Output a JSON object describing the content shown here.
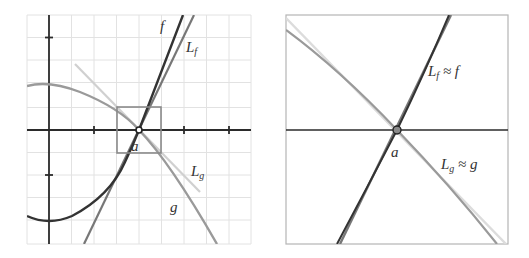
{
  "figure": {
    "left_panel": {
      "description": "Graphs of f and g with their tangent lines L_f and L_g at x = a; a small square marks the zoom region",
      "grid": {
        "x_start": 27,
        "x_end": 251,
        "y_start": 15,
        "y_end": 244,
        "spacing": 22.5
      },
      "axes": {
        "origin_x": 49,
        "origin_y": 130,
        "tick_step_px": 45
      },
      "zoom_box": {
        "x": 117,
        "y": 107,
        "width": 44,
        "height": 46
      },
      "point_a": {
        "x": 139,
        "y": 130
      },
      "labels": {
        "f": "f",
        "L_f_main": "L",
        "L_f_sub": "f",
        "L_g_main": "L",
        "L_g_sub": "g",
        "g": "g",
        "a": "a"
      }
    },
    "right_panel": {
      "description": "Zoomed view near a: the curves are indistinguishable from their tangent lines",
      "frame": {
        "x": 286,
        "y": 15,
        "width": 222,
        "height": 229
      },
      "point_a": {
        "x": 397,
        "y": 130
      },
      "labels": {
        "Lf_approx_main": "L",
        "Lf_approx_sub": "f",
        "Lf_approx_rest": " ≈ f",
        "Lg_approx_main": "L",
        "Lg_approx_sub": "g",
        "Lg_approx_rest": " ≈ g",
        "a": "a"
      }
    },
    "colors": {
      "grid": "#e2e2e2",
      "axis": "#2b2b2b",
      "f_curve": "#333333",
      "tangent_f": "#777777",
      "g_curve": "#9a9a9a",
      "tangent_g": "#d0d0d0",
      "zoom_box": "#8a8a8a",
      "frame": "#b5b5b5"
    }
  }
}
